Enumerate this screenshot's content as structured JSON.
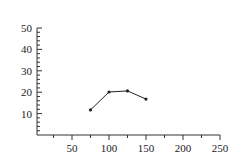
{
  "chart_data": {
    "type": "line",
    "title": "",
    "xlabel": "",
    "ylabel": "",
    "xlim": [
      0,
      250
    ],
    "ylim": [
      0,
      50
    ],
    "x_ticks": [
      50,
      100,
      150,
      200,
      250
    ],
    "y_ticks": [
      10,
      20,
      30,
      40,
      50
    ],
    "x_tick_labels": [
      "50",
      "100",
      "150",
      "200",
      "250"
    ],
    "y_tick_labels": [
      "10",
      "20",
      "30",
      "40",
      "50"
    ],
    "grid": false,
    "legend": null,
    "series": [
      {
        "name": "series-1",
        "x": [
          75,
          100,
          125,
          150
        ],
        "y": [
          11.7,
          20.1,
          20.6,
          16.8
        ],
        "color": "#222222",
        "marker": "dot"
      }
    ]
  }
}
